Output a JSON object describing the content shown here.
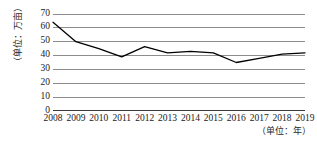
{
  "chart_data": {
    "type": "line",
    "title": "",
    "xlabel": "（单位：年）",
    "ylabel": "（单位：万亩）",
    "categories": [
      "2008",
      "2009",
      "2010",
      "2011",
      "2012",
      "2013",
      "2014",
      "2015",
      "2016",
      "2017",
      "2018",
      "2019"
    ],
    "values": [
      64,
      50,
      45,
      39,
      46.5,
      42,
      43,
      42,
      35,
      38,
      41,
      42
    ],
    "series": [
      {
        "name": "面积",
        "values": [
          64,
          50,
          45,
          39,
          46.5,
          42,
          43,
          42,
          35,
          38,
          41,
          42
        ]
      }
    ],
    "ylim": [
      0,
      70
    ],
    "yticks": [
      0,
      10,
      20,
      30,
      40,
      50,
      60,
      70
    ],
    "ytick_labels": [
      "0",
      "10",
      "20",
      "30",
      "40",
      "50",
      "60",
      "70"
    ],
    "grid": true,
    "grid_axis": "y",
    "legend": false,
    "legend_position": "none",
    "line_color": "#000000",
    "grid_color": "#8d8d8d",
    "background_color": "#ffffff",
    "markers": false
  }
}
